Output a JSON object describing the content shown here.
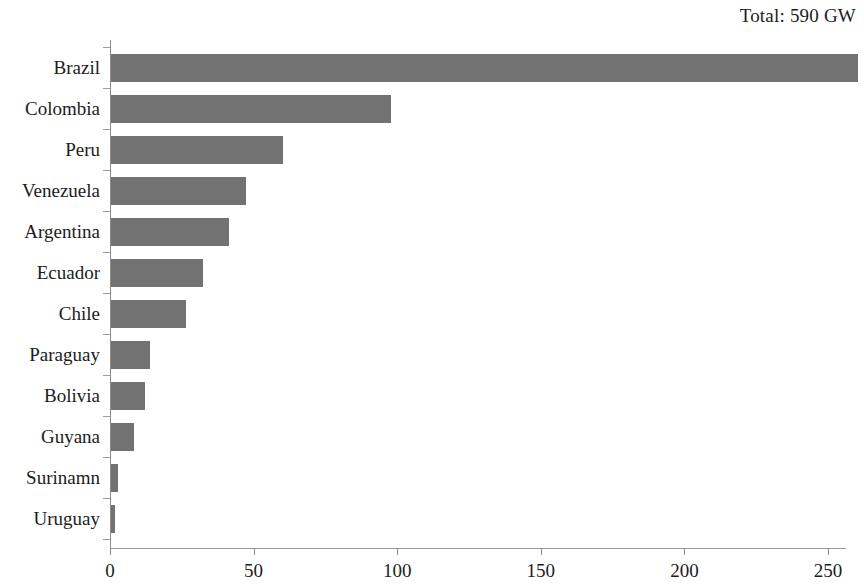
{
  "chart_data": {
    "type": "bar",
    "orientation": "horizontal",
    "title": "Total: 590 GW",
    "xlabel": "",
    "ylabel": "",
    "categories": [
      "Brazil",
      "Colombia",
      "Peru",
      "Venezuela",
      "Argentina",
      "Ecuador",
      "Chile",
      "Paraguay",
      "Bolivia",
      "Guyana",
      "Surinamn",
      "Uruguay"
    ],
    "values": [
      260,
      97.5,
      60,
      47,
      41,
      32,
      26,
      13.5,
      12,
      8,
      2.5,
      1.5
    ],
    "unit": "GW",
    "xlim": [
      0,
      265
    ],
    "xticks": [
      0,
      50,
      100,
      150,
      200,
      250
    ],
    "xtick_labels": [
      "0",
      "50",
      "100",
      "150",
      "200",
      "250"
    ],
    "grid": false,
    "legend": null,
    "bar_color": "#727272",
    "background_color": "#ffffff",
    "axis_color": "#8d8d8d",
    "text_color": "#1c1c1c"
  }
}
